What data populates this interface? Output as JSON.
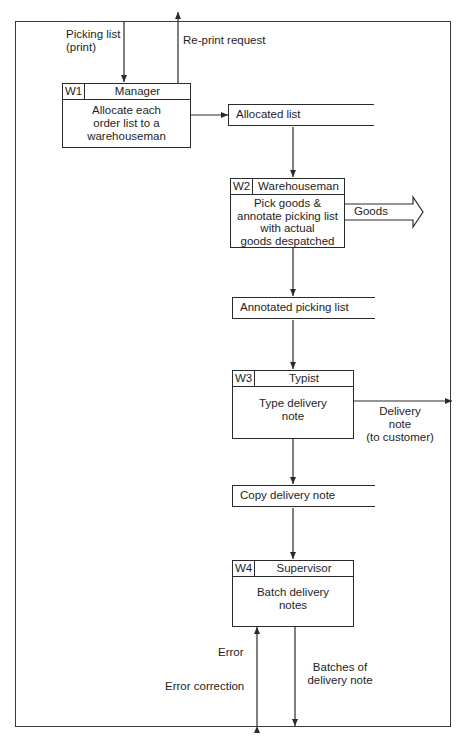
{
  "diagram": {
    "type": "data-flow / procedure flowchart",
    "processes": [
      {
        "id": "W1",
        "role": "Manager",
        "description": "Allocate each\norder list to a\nwarehouseman"
      },
      {
        "id": "W2",
        "role": "Warehouseman",
        "description": "Pick goods &\nannotate picking list\nwith actual\ngoods despatched"
      },
      {
        "id": "W3",
        "role": "Typist",
        "description": "Type delivery\nnote"
      },
      {
        "id": "W4",
        "role": "Supervisor",
        "description": "Batch delivery\nnotes"
      }
    ],
    "stores": [
      {
        "label": "Allocated list"
      },
      {
        "label": "Annotated picking list"
      },
      {
        "label": "Copy delivery note"
      }
    ],
    "flows": {
      "picking_list": "Picking list\n(print)",
      "reprint_request": "Re-print request",
      "goods": "Goods",
      "delivery_note": "Delivery\nnote\n(to customer)",
      "error": "Error",
      "error_correction": "Error correction",
      "batches": "Batches of\ndelivery note"
    }
  },
  "colors": {
    "line": "#2a2a2a",
    "background": "#ffffff"
  }
}
